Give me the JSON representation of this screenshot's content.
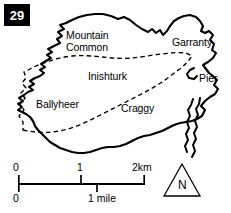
{
  "figure": {
    "page_number": "29"
  },
  "map": {
    "place_labels": [
      {
        "name": "mountain-common",
        "text_line1": "Mountain",
        "text_line2": "Common",
        "x": 66,
        "y": 30
      },
      {
        "name": "garranty",
        "text": "Garranty",
        "x": 172,
        "y": 37
      },
      {
        "name": "inishturk",
        "text": "Inishturk",
        "x": 88,
        "y": 71
      },
      {
        "name": "pier",
        "text": "Pier",
        "x": 199,
        "y": 73
      },
      {
        "name": "ballyheer",
        "text": "Ballyheer",
        "x": 36,
        "y": 99
      },
      {
        "name": "craggy",
        "text": "Craggy",
        "x": 121,
        "y": 103
      }
    ]
  },
  "scale_bar": {
    "km_labels": [
      {
        "text": "0",
        "x": 13,
        "y": 162
      },
      {
        "text": "1",
        "x": 77,
        "y": 162
      },
      {
        "text": "2km",
        "x": 132,
        "y": 162
      }
    ],
    "mile_labels": [
      {
        "text": "0",
        "x": 13,
        "y": 193
      },
      {
        "text": "1 mile",
        "x": 88,
        "y": 193
      }
    ],
    "bar_start_x": 18,
    "bar_end_x": 145,
    "bar_y": 184,
    "km_tick_positions": [
      18,
      81,
      145
    ],
    "mile_tick_positions": [
      18,
      97
    ]
  },
  "north_arrow": {
    "letter": "N"
  },
  "colors": {
    "ink": "#000000",
    "paper": "#ffffff"
  }
}
